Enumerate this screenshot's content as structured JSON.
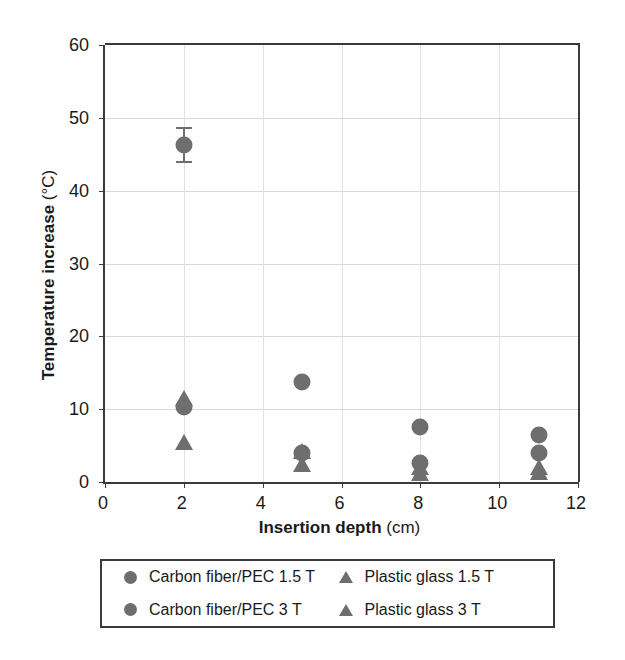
{
  "chart_data": {
    "type": "scatter",
    "title": "",
    "xlabel_bold": "Insertion depth",
    "xlabel_light": "(cm)",
    "ylabel_bold": "Temperature increase",
    "ylabel_light": "(°C)",
    "xlim": [
      0,
      12
    ],
    "ylim": [
      0,
      60
    ],
    "xticks": [
      0,
      2,
      4,
      6,
      8,
      10,
      12
    ],
    "xticklabels": [
      "0",
      "2",
      "4",
      "6",
      "8",
      "10",
      "12"
    ],
    "yticks": [
      0,
      10,
      20,
      30,
      40,
      50,
      60
    ],
    "yticklabels": [
      "0",
      "10",
      "20",
      "30",
      "40",
      "50",
      "60"
    ],
    "grid": "both-light",
    "legend_position": "below-plot",
    "marker_color": "#6e6e6e",
    "axis_color": "#3a3a3a",
    "grid_color": "#d8d8d8",
    "series": [
      {
        "name": "Carbon fiber/PEC 1.5 T",
        "marker": "circle",
        "color": "#6e6e6e",
        "x": [
          2,
          5,
          8,
          11
        ],
        "values": [
          10.3,
          4.0,
          2.6,
          4.0
        ],
        "errors": [
          0,
          0,
          0,
          0
        ]
      },
      {
        "name": "Carbon fiber/PEC 3 T",
        "marker": "circle",
        "color": "#6e6e6e",
        "x": [
          2,
          5,
          8,
          11
        ],
        "values": [
          46.3,
          13.7,
          7.6,
          6.5
        ],
        "errors": [
          2.3,
          0,
          0,
          0
        ]
      },
      {
        "name": "Plastic glass 1.5 T",
        "marker": "triangle",
        "color": "#6e6e6e",
        "x": [
          2,
          5,
          8,
          11
        ],
        "values": [
          5.5,
          2.5,
          1.2,
          1.4
        ],
        "errors": [
          0,
          0,
          0,
          0
        ]
      },
      {
        "name": "Plastic glass 3 T",
        "marker": "triangle",
        "color": "#6e6e6e",
        "x": [
          2,
          5,
          8,
          11
        ],
        "values": [
          11.5,
          4.3,
          2.0,
          2.0
        ],
        "errors": [
          0,
          0,
          0,
          0
        ]
      }
    ]
  },
  "legend": {
    "entries": [
      {
        "label": "Carbon fiber/PEC 1.5 T",
        "marker": "circle",
        "color": "#6e6e6e"
      },
      {
        "label": "Plastic glass 1.5 T",
        "marker": "triangle",
        "color": "#6e6e6e"
      },
      {
        "label": "Carbon fiber/PEC 3 T",
        "marker": "circle",
        "color": "#6e6e6e"
      },
      {
        "label": "Plastic glass 3 T",
        "marker": "triangle",
        "color": "#6e6e6e"
      }
    ]
  }
}
